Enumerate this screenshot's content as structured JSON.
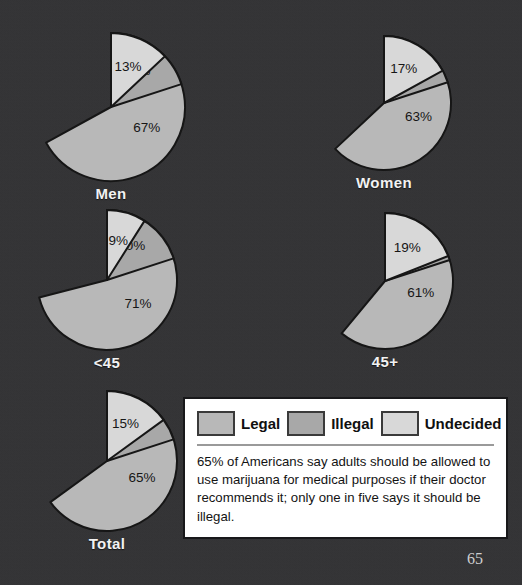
{
  "page": {
    "background_color": "#333335",
    "page_number": "65"
  },
  "colors": {
    "legal": "#b8b8b8",
    "illegal": "#a8a8a8",
    "undecided": "#d8d8d8",
    "slice_outline": "#161616",
    "caption_text": "#f2f2f2"
  },
  "chart_data": {
    "type": "pie",
    "title": "",
    "legend": {
      "position": "bottom-right",
      "entries": [
        {
          "label": "Legal",
          "color": "#b8b8b8"
        },
        {
          "label": "Illegal",
          "color": "#a8a8a8"
        },
        {
          "label": "Undecided",
          "color": "#d8d8d8"
        }
      ]
    },
    "categories": [
      "Legal",
      "Illegal",
      "Undecided"
    ],
    "charts": [
      {
        "name": "Men",
        "label": "Men",
        "values": [
          67,
          20,
          13
        ],
        "data_labels": [
          "67%",
          "20%",
          "13%"
        ]
      },
      {
        "name": "Women",
        "label": "Women",
        "values": [
          63,
          20,
          17
        ],
        "data_labels": [
          "63%",
          "20%",
          "17%"
        ]
      },
      {
        "name": "Under 45",
        "label": "<45",
        "values": [
          71,
          20,
          9
        ],
        "data_labels": [
          "71%",
          "20%",
          "9%"
        ]
      },
      {
        "name": "45 and over",
        "label": "45+",
        "values": [
          61,
          20,
          19
        ],
        "data_labels": [
          "61%",
          "20%",
          "19%"
        ]
      },
      {
        "name": "Total",
        "label": "Total",
        "values": [
          65,
          20,
          15
        ],
        "data_labels": [
          "65%",
          "20%",
          "15%"
        ]
      }
    ],
    "caption": "65% of Americans say adults should be allowed to use marijuana for medical purposes if their doctor recommends it; only one in five says it should be illegal."
  },
  "legend": {
    "items": [
      {
        "label": "Legal"
      },
      {
        "label": "Illegal"
      },
      {
        "label": "Undecided"
      }
    ],
    "caption": "65% of Americans say adults should be allowed to use marijuana for medical purposes if their doctor recommends it; only one in five says it should be illegal."
  }
}
